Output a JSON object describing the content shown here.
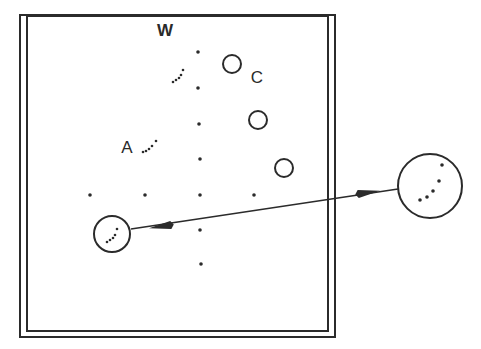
{
  "figure": {
    "type": "schematic-field-diagram",
    "ink_color": "#2b2b2b",
    "background_color": "#ffffff",
    "frame": {
      "outer": {
        "x": 20,
        "y": 15,
        "w": 315,
        "h": 322
      },
      "inner": {
        "x": 27,
        "y": 16,
        "w": 301,
        "h": 315
      }
    },
    "labels": [
      {
        "id": "W",
        "text": "W",
        "x": 165,
        "y": 36,
        "size": 17,
        "weight": "bold"
      },
      {
        "id": "A",
        "text": "A",
        "x": 127,
        "y": 153,
        "size": 17,
        "weight": "normal"
      },
      {
        "id": "C",
        "text": "C",
        "x": 257,
        "y": 83,
        "size": 17,
        "weight": "normal"
      }
    ],
    "grid_dots": [
      {
        "x": 198,
        "y": 52
      },
      {
        "x": 198,
        "y": 88
      },
      {
        "x": 199,
        "y": 124
      },
      {
        "x": 200,
        "y": 159
      },
      {
        "x": 90,
        "y": 195
      },
      {
        "x": 145,
        "y": 195
      },
      {
        "x": 200,
        "y": 195
      },
      {
        "x": 254,
        "y": 195
      },
      {
        "x": 200,
        "y": 230
      },
      {
        "x": 201,
        "y": 264
      }
    ],
    "hollow_circles": [
      {
        "x": 232,
        "y": 64,
        "r": 9
      },
      {
        "x": 258,
        "y": 120,
        "r": 9
      },
      {
        "x": 284,
        "y": 168,
        "r": 9
      }
    ],
    "dot_arcs": [
      {
        "id": "W-arc",
        "points": [
          [
            173,
            82
          ],
          [
            176,
            80
          ],
          [
            179,
            78
          ],
          [
            181,
            75
          ],
          [
            183,
            70
          ]
        ]
      },
      {
        "id": "A-arc",
        "points": [
          [
            143,
            152
          ],
          [
            146,
            151
          ],
          [
            149,
            149
          ],
          [
            152,
            146
          ],
          [
            156,
            141
          ]
        ]
      }
    ],
    "small_circle": {
      "x": 112,
      "y": 234,
      "r": 18,
      "dots": [
        [
          107,
          242
        ],
        [
          110,
          240
        ],
        [
          113,
          238
        ],
        [
          115,
          235
        ],
        [
          117,
          229
        ]
      ]
    },
    "magnified_circle": {
      "x": 430,
      "y": 186,
      "r": 32,
      "dots": [
        [
          420,
          200
        ],
        [
          427,
          197
        ],
        [
          433,
          191
        ],
        [
          439,
          181
        ],
        [
          442,
          165
        ]
      ]
    },
    "connector": {
      "from": [
        131,
        229
      ],
      "to": [
        398,
        189
      ],
      "arrowheads": "both",
      "arrowhead_near_start": [
        163,
        226
      ],
      "arrowhead_near_end": [
        366,
        193
      ]
    }
  }
}
